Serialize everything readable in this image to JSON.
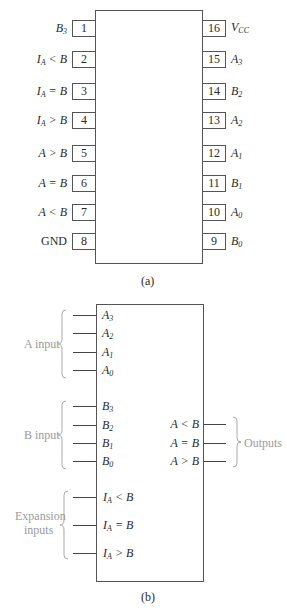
{
  "figure_a": {
    "caption": "(a)",
    "left_pins": [
      {
        "num": "1",
        "name": "B",
        "sub": "3",
        "suffix": ""
      },
      {
        "num": "2",
        "name": "I",
        "sub": "A",
        "suffix": " < B"
      },
      {
        "num": "3",
        "name": "I",
        "sub": "A",
        "suffix": " = B"
      },
      {
        "num": "4",
        "name": "I",
        "sub": "A",
        "suffix": " > B"
      },
      {
        "num": "5",
        "name": "A > B",
        "sub": "",
        "suffix": ""
      },
      {
        "num": "6",
        "name": "A = B",
        "sub": "",
        "suffix": ""
      },
      {
        "num": "7",
        "name": "A < B",
        "sub": "",
        "suffix": ""
      },
      {
        "num": "8",
        "name": "GND",
        "sub": "",
        "suffix": ""
      }
    ],
    "right_pins": [
      {
        "num": "16",
        "name": "V",
        "sub": "CC"
      },
      {
        "num": "15",
        "name": "A",
        "sub": "3"
      },
      {
        "num": "14",
        "name": "B",
        "sub": "2"
      },
      {
        "num": "13",
        "name": "A",
        "sub": "2"
      },
      {
        "num": "12",
        "name": "A",
        "sub": "1"
      },
      {
        "num": "11",
        "name": "B",
        "sub": "1"
      },
      {
        "num": "10",
        "name": "A",
        "sub": "0"
      },
      {
        "num": "9",
        "name": "B",
        "sub": "0"
      }
    ]
  },
  "figure_b": {
    "caption": "(b)",
    "groups": {
      "a_input": "A input",
      "b_input": "B input",
      "expansion_line1": "Expansion",
      "expansion_line2": "inputs",
      "outputs": "Outputs"
    },
    "a_inputs": [
      {
        "name": "A",
        "sub": "3"
      },
      {
        "name": "A",
        "sub": "2"
      },
      {
        "name": "A",
        "sub": "1"
      },
      {
        "name": "A",
        "sub": "0"
      }
    ],
    "b_inputs": [
      {
        "name": "B",
        "sub": "3"
      },
      {
        "name": "B",
        "sub": "2"
      },
      {
        "name": "B",
        "sub": "1"
      },
      {
        "name": "B",
        "sub": "0"
      }
    ],
    "expansion_inputs": [
      {
        "name": "I",
        "sub": "A",
        "suffix": " < B"
      },
      {
        "name": "I",
        "sub": "A",
        "suffix": " = B"
      },
      {
        "name": "I",
        "sub": "A",
        "suffix": " > B"
      }
    ],
    "outputs": [
      "A < B",
      "A = B",
      "A > B"
    ]
  }
}
